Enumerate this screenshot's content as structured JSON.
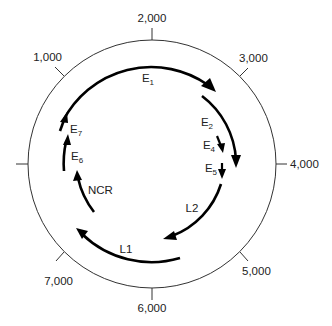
{
  "diagram": {
    "ticks": [
      {
        "label": "1,000"
      },
      {
        "label": "2,000"
      },
      {
        "label": "3,000"
      },
      {
        "label": "4,000"
      },
      {
        "label": "5,000"
      },
      {
        "label": "6,000"
      },
      {
        "label": "7,000"
      },
      {
        "label": ""
      }
    ],
    "genes": [
      {
        "name": "E",
        "sub": "1"
      },
      {
        "name": "E",
        "sub": "2"
      },
      {
        "name": "E",
        "sub": "4"
      },
      {
        "name": "E",
        "sub": "5"
      },
      {
        "name": "L2",
        "sub": ""
      },
      {
        "name": "L1",
        "sub": ""
      },
      {
        "name": "NCR",
        "sub": ""
      },
      {
        "name": "E",
        "sub": "6"
      },
      {
        "name": "E",
        "sub": "7"
      }
    ],
    "colors": {
      "ring": "#333333",
      "arrows": "#000000",
      "text": "#222222",
      "background": "#ffffff"
    }
  }
}
